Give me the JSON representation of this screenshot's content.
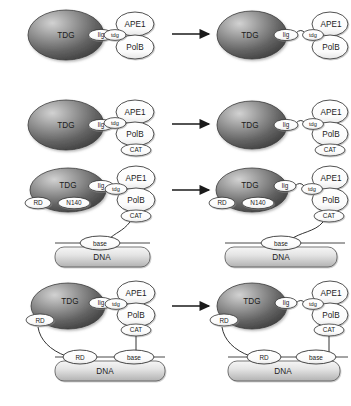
{
  "diagram": {
    "type": "protein-interaction-schematic",
    "rows": 4,
    "panels_per_row": 2,
    "arrow_symbol": "→",
    "colors": {
      "blob_dark": "#4a4a4a",
      "blob_light": "#c9c9c9",
      "ellipse_fill": "#ffffff",
      "outline": "#333333",
      "dna_light": "#efefef",
      "dna_dark": "#b9b9b9",
      "arrow": "#1a1a1a",
      "text": "#1b1b1b"
    },
    "labels": {
      "tdg_blob": "TDG",
      "lig": "lig",
      "tdg_tag": "tdg",
      "ape1": "APE1",
      "polb": "PolB",
      "cat": "CAT",
      "rd": "RD",
      "n140": "N140",
      "base": "base",
      "dna": "DNA"
    },
    "rows_content": [
      {
        "index": 1,
        "left": {
          "blob": "TDG",
          "blob_tag": "lig",
          "complex_tag": "tdg",
          "complex": [
            "APE1",
            "PolB"
          ],
          "dna": null,
          "bound": false
        },
        "right": {
          "blob": "TDG",
          "blob_tag": "lig",
          "complex_tag": "tdg",
          "complex": [
            "APE1",
            "PolB"
          ],
          "dna": null,
          "bound": true
        }
      },
      {
        "index": 2,
        "left": {
          "blob": "TDG",
          "blob_tag": "lig",
          "complex_tag": "tdg",
          "complex": [
            "APE1",
            "PolB",
            "CAT"
          ],
          "dna": null,
          "bound": false
        },
        "right": {
          "blob": "TDG",
          "blob_tag": "lig",
          "complex_tag": "tdg",
          "complex": [
            "APE1",
            "PolB",
            "CAT"
          ],
          "dna": null,
          "bound": true
        }
      },
      {
        "index": 3,
        "left": {
          "blob": "TDG",
          "blob_tag": "lig",
          "blob_sub_tags": [
            "RD",
            "N140"
          ],
          "complex_tag": "tdg",
          "complex": [
            "APE1",
            "PolB",
            "CAT"
          ],
          "dna": {
            "label": "DNA",
            "nodes": [
              "base"
            ]
          },
          "bound": false
        },
        "right": {
          "blob": "TDG",
          "blob_tag": "lig",
          "blob_sub_tags": [
            "RD",
            "N140"
          ],
          "complex_tag": "tdg",
          "complex": [
            "APE1",
            "PolB",
            "CAT"
          ],
          "dna": {
            "label": "DNA",
            "nodes": [
              "base"
            ]
          },
          "bound": true
        }
      },
      {
        "index": 4,
        "left": {
          "blob": "TDG",
          "blob_tag": "lig",
          "blob_sub_tags": [
            "RD"
          ],
          "complex_tag": "tdg",
          "complex": [
            "APE1",
            "PolB",
            "CAT"
          ],
          "dna": {
            "label": "DNA",
            "nodes": [
              "RD",
              "base"
            ]
          },
          "bound": false
        },
        "right": {
          "blob": "TDG",
          "blob_tag": "lig",
          "blob_sub_tags": [
            "RD"
          ],
          "complex_tag": "tdg",
          "complex": [
            "APE1",
            "PolB",
            "CAT"
          ],
          "dna": {
            "label": "DNA",
            "nodes": [
              "RD",
              "base"
            ]
          },
          "bound": true
        }
      }
    ]
  }
}
